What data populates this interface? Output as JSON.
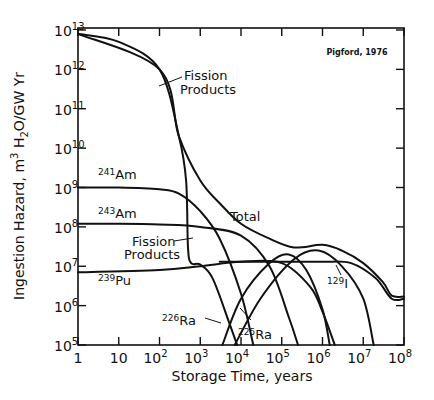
{
  "chart_data": {
    "type": "line",
    "title": "",
    "credit": "Pigford, 1976",
    "xlabel": "Storage Time, years",
    "ylabel": "Ingestion Hazard, m³ H₂O/GW Yr",
    "xscale": "log",
    "yscale": "log",
    "xlim": [
      1,
      100000000
    ],
    "ylim": [
      100000,
      10000000000000
    ],
    "x_ticks": [
      {
        "base": "1",
        "exp": ""
      },
      {
        "base": "10",
        "exp": ""
      },
      {
        "base": "10",
        "exp": "2"
      },
      {
        "base": "10",
        "exp": "3"
      },
      {
        "base": "10",
        "exp": "4"
      },
      {
        "base": "10",
        "exp": "5"
      },
      {
        "base": "10",
        "exp": "6"
      },
      {
        "base": "10",
        "exp": "7"
      },
      {
        "base": "10",
        "exp": "8"
      }
    ],
    "y_ticks": [
      {
        "base": "10",
        "exp": "13"
      },
      {
        "base": "10",
        "exp": "12"
      },
      {
        "base": "10",
        "exp": "11"
      },
      {
        "base": "10",
        "exp": "10"
      },
      {
        "base": "10",
        "exp": "9"
      },
      {
        "base": "10",
        "exp": "8"
      },
      {
        "base": "10",
        "exp": "7"
      },
      {
        "base": "10",
        "exp": "6"
      },
      {
        "base": "10",
        "exp": "5"
      }
    ],
    "grid": false,
    "legend": "inline annotations",
    "series": [
      {
        "name": "Fission Products",
        "x": [
          1,
          10,
          100,
          300,
          450,
          500,
          600,
          1000,
          2000,
          5000,
          8000
        ],
        "y": [
          8000000000000.0,
          5000000000000.0,
          1000000000000.0,
          20000000000.0,
          1500000000.0,
          30000000.0,
          12000000.0,
          11000000.0,
          5000000.0,
          400000.0,
          100000.0
        ]
      },
      {
        "name": "241Am",
        "x": [
          1,
          10,
          100,
          300,
          1000,
          3000,
          10000,
          20000
        ],
        "y": [
          1000000000.0,
          1000000000.0,
          900000000.0,
          700000000.0,
          250000000.0,
          50000000.0,
          2000000.0,
          100000.0
        ]
      },
      {
        "name": "243Am",
        "x": [
          1,
          10,
          100,
          1000,
          10000,
          50000,
          150000,
          250000
        ],
        "y": [
          120000000.0,
          120000000.0,
          115000000.0,
          100000000.0,
          60000000.0,
          10000000.0,
          500000.0,
          100000.0
        ]
      },
      {
        "name": "239Pu",
        "x": [
          1,
          100,
          1000,
          10000,
          100000,
          500000,
          1000000,
          2000000
        ],
        "y": [
          7000000.0,
          8000000.0,
          10000000.0,
          13000000.0,
          12000000.0,
          3000000.0,
          700000.0,
          100000.0
        ]
      },
      {
        "name": "226Ra",
        "x": [
          3500,
          10000,
          50000,
          150000,
          400000,
          1000000,
          1500000
        ],
        "y": [
          100000.0,
          1500000.0,
          12000000.0,
          20000000.0,
          8000000.0,
          800000.0,
          100000.0
        ]
      },
      {
        "name": "225Ra",
        "x": [
          7000,
          30000,
          200000,
          800000,
          3000000,
          10000000,
          18000000
        ],
        "y": [
          100000.0,
          1500000.0,
          15000000.0,
          25000000.0,
          10000000.0,
          1500000.0,
          100000.0
        ]
      },
      {
        "name": "129I",
        "x": [
          3000,
          100000,
          1000000,
          5000000,
          20000000,
          50000000,
          100000000
        ],
        "y": [
          13000000.0,
          13000000.0,
          13000000.0,
          12000000.0,
          5000000.0,
          1500000.0,
          1500000.0
        ]
      },
      {
        "name": "Total",
        "x": [
          1,
          100,
          300,
          1000,
          3000,
          10000,
          50000,
          200000,
          1000000,
          3000000,
          10000000,
          30000000,
          50000000,
          100000000
        ],
        "y": [
          8000000000000.0,
          1000000000000.0,
          20000000000.0,
          1500000000.0,
          400000000.0,
          120000000.0,
          50000000.0,
          30000000.0,
          35000000.0,
          25000000.0,
          12000000.0,
          4000000.0,
          1800000.0,
          1700000.0
        ]
      }
    ],
    "annotations": [
      {
        "text": "Fission Products",
        "near": "upper curve"
      },
      {
        "text": "Fission Products",
        "near": "lower kink"
      },
      {
        "text": "Total"
      },
      {
        "text": "241Am"
      },
      {
        "text": "243Am"
      },
      {
        "text": "239Pu"
      },
      {
        "text": "226Ra"
      },
      {
        "text": "225Ra"
      },
      {
        "text": "129I"
      }
    ]
  },
  "labels": {
    "credit": "Pigford, 1976",
    "xlabel": "Storage Time, years",
    "ylabel_pre": "Ingestion Hazard, m",
    "ylabel_sup": "3",
    "ylabel_h": " H",
    "ylabel_sub": "2",
    "ylabel_post": "O/GW Yr",
    "fp1_line1": "Fission",
    "fp1_line2": "Products",
    "fp2_line1": "Fission",
    "fp2_line2": "Products",
    "total": "Total",
    "am241_mass": "241",
    "am241_el": "Am",
    "am243_mass": "243",
    "am243_el": "Am",
    "pu239_mass": "239",
    "pu239_el": "Pu",
    "ra226_mass": "226",
    "ra226_el": "Ra",
    "ra225_mass": "225",
    "ra225_el": "Ra",
    "i129_mass": "129",
    "i129_el": "I"
  }
}
